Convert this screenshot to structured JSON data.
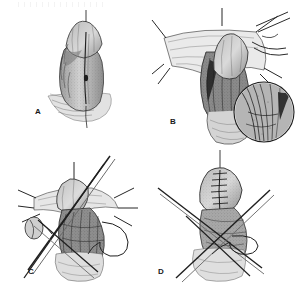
{
  "figure": {
    "medium": "grayscale pen-and-ink line drawing with stipple shading",
    "background_color": "#ffffff",
    "ink_color": "#1f1f1f",
    "midtone_color": "#8c8c8c",
    "light_tone_color": "#c9c9c9",
    "panel_count": 4,
    "layout": "2 x 2 grid"
  },
  "panels": [
    {
      "label": "A",
      "name": "panel-a",
      "position": "top-left",
      "caption_text": "A",
      "description": "Organ shown intact with a vertical midline incision line marked; a fine traction suture extends from the apex.",
      "features": [
        "vertical midline incision line",
        "apical traction suture",
        "stippled shading on shaft",
        "light wash at base"
      ]
    },
    {
      "label": "B",
      "name": "panel-b",
      "position": "top-right",
      "caption_text": "B",
      "description": "Wound edges retracted outward by radiating stay sutures exposing deeper tissue planes; a circular magnified inset at lower right shows vessel and nerve detail.",
      "features": [
        "radiating stay sutures",
        "retracted skin flaps",
        "exposed deep tissue plane",
        "circular magnified inset detail",
        "crossing instrument shafts at right"
      ],
      "inset": {
        "name": "magnified-inset",
        "shape": "circle",
        "description": "Close-up of neurovascular bundle detail"
      }
    },
    {
      "label": "C",
      "name": "panel-c",
      "position": "bottom-left",
      "caption_text": "C",
      "description": "Dissection stage with long straight instruments crossing diagonally across the field and a free suture loop curving at the right.",
      "features": [
        "crossed long instrument shafts",
        "open suture loop",
        "radiating stay sutures",
        "clamp at left margin",
        "dense cross-hatched deep tissue"
      ]
    },
    {
      "label": "D",
      "name": "panel-d",
      "position": "bottom-right",
      "caption_text": "D",
      "description": "Completed closure showing a ladder-like interrupted suture line along the repaired surface, with instruments and a suture loop still in the field.",
      "features": [
        "ladder-pattern interrupted suture line",
        "completed closure",
        "crossed instrument shafts",
        "suture loop",
        "apical traction suture"
      ]
    }
  ]
}
